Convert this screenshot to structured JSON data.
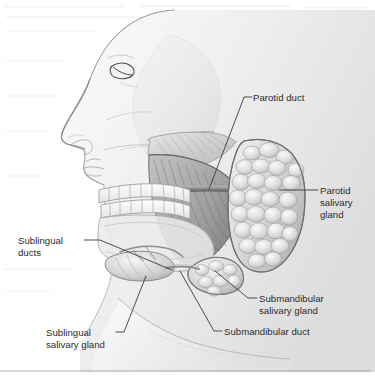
{
  "figure": {
    "type": "anatomical-illustration",
    "background_color": "#ffffff",
    "line_color": "#3a3a3a",
    "text_color": "#2b2b2b",
    "width": 375,
    "height": 386
  },
  "labels": [
    {
      "id": "parotid-duct",
      "lines": [
        "Parotid duct"
      ],
      "text_x": 253,
      "text_y": 101,
      "anchor": "start"
    },
    {
      "id": "parotid-salivary-gland",
      "lines": [
        "Parotid",
        "salivary",
        "gland"
      ],
      "text_x": 320,
      "text_y": 194,
      "anchor": "start"
    },
    {
      "id": "sublingual-ducts",
      "lines": [
        "Sublingual",
        "ducts"
      ],
      "text_x": 18,
      "text_y": 244,
      "anchor": "start"
    },
    {
      "id": "submandibular-salivary-gland",
      "lines": [
        "Submandibular",
        "salivary gland"
      ],
      "text_x": 259,
      "text_y": 302,
      "anchor": "start"
    },
    {
      "id": "submandibular-duct",
      "lines": [
        "Submandibular duct"
      ],
      "text_x": 224,
      "text_y": 335,
      "anchor": "start"
    },
    {
      "id": "sublingual-salivary-gland",
      "lines": [
        "Sublingual",
        "salivary gland"
      ],
      "text_x": 46,
      "text_y": 336,
      "anchor": "start"
    }
  ],
  "anatomy_parts": [
    {
      "id": "head-profile",
      "name": "Head and face profile"
    },
    {
      "id": "skull-cranium",
      "name": "Cranium outline"
    },
    {
      "id": "maxilla-teeth",
      "name": "Upper teeth row (maxilla)"
    },
    {
      "id": "mandible-teeth",
      "name": "Lower teeth row (mandible)"
    },
    {
      "id": "mandible-bone",
      "name": "Mandible"
    },
    {
      "id": "masseter-muscle",
      "name": "Masseter muscle"
    },
    {
      "id": "temporalis-muscle",
      "name": "Temporalis muscle"
    },
    {
      "id": "parotid-gland-body",
      "name": "Parotid salivary gland (lobulated)"
    },
    {
      "id": "parotid-duct-tube",
      "name": "Parotid duct (Stensen's duct)"
    },
    {
      "id": "submandibular-gland-body",
      "name": "Submandibular salivary gland"
    },
    {
      "id": "submandibular-duct-tube",
      "name": "Submandibular duct (Wharton's duct)"
    },
    {
      "id": "sublingual-gland-body",
      "name": "Sublingual salivary gland"
    },
    {
      "id": "sublingual-duct-tubes",
      "name": "Sublingual ducts"
    },
    {
      "id": "neck",
      "name": "Neck"
    },
    {
      "id": "nose",
      "name": "Nose"
    },
    {
      "id": "eye",
      "name": "Eye"
    },
    {
      "id": "lips",
      "name": "Lips"
    }
  ],
  "bleed_through_note": "faint scanned page show-through at top and middle",
  "bottom_rule": {
    "y": 371,
    "x1": 0,
    "x2": 371
  }
}
